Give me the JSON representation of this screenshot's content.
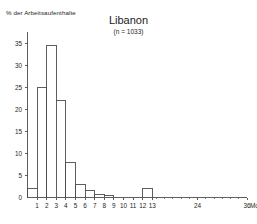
{
  "chart_data": {
    "type": "bar",
    "title": "Libanon",
    "subtitle": "(n = 1033)",
    "xlabel": "",
    "ylabel": "% der Arbeitsaufenthalte",
    "xunit": "Monate",
    "ylim": [
      0,
      37
    ],
    "yticks": [
      0,
      5,
      10,
      15,
      20,
      25,
      30,
      35
    ],
    "ytick_labels": [
      "0",
      "5",
      "10",
      "15",
      "20",
      "25",
      "30",
      "35"
    ],
    "xticks": [
      1,
      2,
      3,
      4,
      5,
      6,
      7,
      8,
      9,
      10,
      11,
      12,
      13,
      24,
      36
    ],
    "xtick_labels": [
      "1",
      "2",
      "3",
      "4",
      "5",
      "6",
      "7",
      "8",
      "9",
      "10",
      "11",
      "12",
      "13",
      "24",
      "36"
    ],
    "grid": false,
    "legend": "none",
    "bar_style": "open-outline-histogram",
    "categories": [
      "0-1",
      "1-2",
      "2-3",
      "3-4",
      "4-5",
      "5-6",
      "6-7",
      "7-8",
      "8-9",
      "9-10",
      "10-11",
      "11-12",
      "12-13",
      "13-24",
      "24-36"
    ],
    "bin_edges": [
      0,
      1,
      2,
      3,
      4,
      5,
      6,
      7,
      8,
      9,
      10,
      11,
      12,
      13,
      24,
      36
    ],
    "values": [
      2,
      25,
      34.5,
      22,
      8,
      3,
      1.5,
      0.6,
      0.4,
      0,
      0,
      0,
      2,
      0,
      0
    ]
  },
  "colors": {
    "axis": "#4d4d4d",
    "bar_outline": "#4d4d4d",
    "bar_fill": "#ffffff",
    "text": "#1a1a1a",
    "background": "#ffffff"
  }
}
